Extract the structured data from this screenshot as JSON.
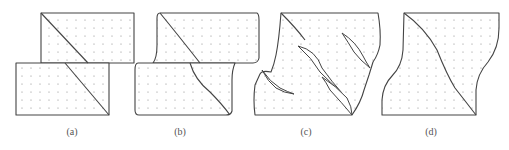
{
  "figure": {
    "panels": [
      {
        "id": "a",
        "label": "(a)",
        "x": 72
      },
      {
        "id": "b",
        "label": "(b)",
        "x": 180
      },
      {
        "id": "c",
        "label": "(c)",
        "x": 306
      },
      {
        "id": "d",
        "label": "(d)",
        "x": 431
      }
    ],
    "colors": {
      "stroke": "#444444",
      "dots": "#888888",
      "background": "#ffffff"
    }
  }
}
